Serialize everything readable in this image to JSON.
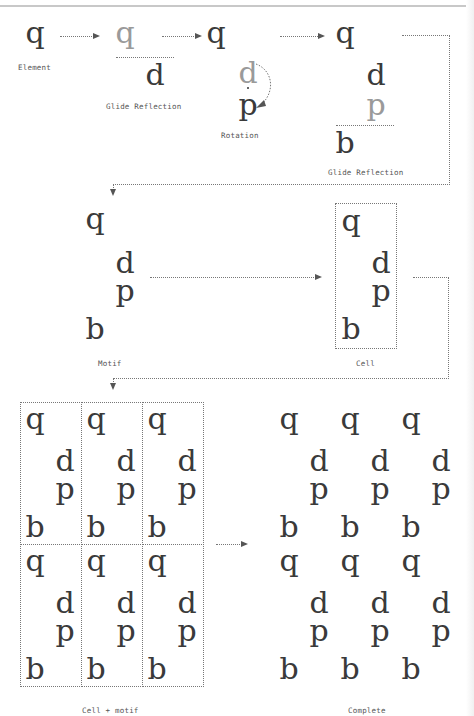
{
  "diagram": {
    "type": "wallpaper-pattern-construction",
    "steps": [
      {
        "label": "Element",
        "glyphs": [
          "q"
        ]
      },
      {
        "label": "Glide Reflection",
        "glyphs": [
          "q",
          "d"
        ]
      },
      {
        "label": "Rotation",
        "glyphs": [
          "d",
          "p"
        ]
      },
      {
        "label": "Glide Reflection",
        "glyphs": [
          "q",
          "d",
          "p",
          "b"
        ]
      },
      {
        "label": "Motif",
        "glyphs": [
          "q",
          "d",
          "p",
          "b"
        ]
      },
      {
        "label": "Cell",
        "glyphs": [
          "q",
          "d",
          "p",
          "b"
        ]
      },
      {
        "label": "Cell + motif",
        "grid": {
          "rows": 2,
          "cols": 3
        }
      },
      {
        "label": "Complete",
        "grid": {
          "rows": 2,
          "cols": 3
        }
      }
    ],
    "labels": {
      "element": "Element",
      "glide1": "Glide Reflection",
      "rotation": "Rotation",
      "glide2": "Glide Reflection",
      "motif": "Motif",
      "cell": "Cell",
      "cell_motif": "Cell + motif",
      "complete": "Complete"
    },
    "glyphs": {
      "q": "q",
      "d": "d",
      "p": "p",
      "b": "b"
    },
    "colors": {
      "ink": "#3a3a3a",
      "ghost": "#9a9a9a",
      "dotted": "#777777"
    }
  }
}
